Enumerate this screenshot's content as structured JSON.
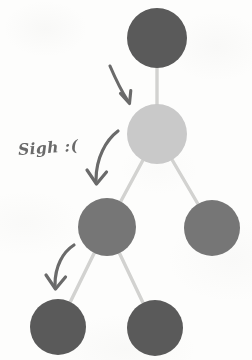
{
  "diagram": {
    "background_color": "#fdfdfc",
    "edge_color": "#d2d2d0",
    "arrow_color": "#5e5e5e",
    "annotation_text": "Sigh :(",
    "nodes": [
      {
        "id": "root",
        "label": "root-node",
        "cx": 157,
        "cy": 38,
        "r": 30,
        "color": "#5a5a5a",
        "shade": "dark",
        "level": 1
      },
      {
        "id": "n2",
        "label": "highlighted-node",
        "cx": 157,
        "cy": 134,
        "r": 30,
        "color": "#c9c9c9",
        "shade": "light",
        "level": 2
      },
      {
        "id": "n3-left",
        "label": "left-child-node",
        "cx": 107,
        "cy": 227,
        "r": 29,
        "color": "#767676",
        "shade": "medium",
        "level": 3
      },
      {
        "id": "n3-right",
        "label": "right-child-node",
        "cx": 212,
        "cy": 228,
        "r": 28,
        "color": "#767676",
        "shade": "medium",
        "level": 3
      },
      {
        "id": "n4-left",
        "label": "leaf-node-left",
        "cx": 58,
        "cy": 327,
        "r": 28,
        "color": "#5a5a5a",
        "shade": "dark",
        "level": 4
      },
      {
        "id": "n4-right",
        "label": "leaf-node-right",
        "cx": 155,
        "cy": 328,
        "r": 28,
        "color": "#5a5a5a",
        "shade": "dark",
        "level": 4
      }
    ],
    "edges": [
      {
        "id": "edge-root-n2",
        "from": "root",
        "to": "n2"
      },
      {
        "id": "edge-n2-n3left",
        "from": "n2",
        "to": "n3-left"
      },
      {
        "id": "edge-n2-n3right",
        "from": "n2",
        "to": "n3-right"
      },
      {
        "id": "edge-n3left-n4left",
        "from": "n3-left",
        "to": "n4-left"
      },
      {
        "id": "edge-n3left-n4right",
        "from": "n3-left",
        "to": "n4-right"
      }
    ],
    "arrows": [
      {
        "id": "arrow-1",
        "label": "traversal-arrow-root-to-level2",
        "step": 1
      },
      {
        "id": "arrow-2",
        "label": "traversal-arrow-level2-to-level3",
        "step": 2
      },
      {
        "id": "arrow-3",
        "label": "traversal-arrow-level3-to-leaf",
        "step": 3
      }
    ],
    "annotation_position": {
      "x": 18,
      "y": 140
    }
  }
}
